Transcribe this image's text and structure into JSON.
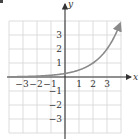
{
  "chart_data": {
    "type": "line",
    "title": "",
    "xlabel": "x",
    "ylabel": "y",
    "xlim": [
      -4,
      4
    ],
    "ylim": [
      -4,
      4
    ],
    "grid": true,
    "x_ticks": [
      -3,
      -2,
      -1,
      1,
      2,
      3
    ],
    "y_ticks": [
      -3,
      -2,
      -1,
      1,
      2,
      3
    ],
    "x_tick_labels": [
      "−3",
      "−2",
      "−1",
      "1",
      "2",
      "3"
    ],
    "y_tick_labels": [
      "−3",
      "−2",
      "−1",
      "1",
      "2",
      "3"
    ],
    "series": [
      {
        "name": "y = 2^(x-2)",
        "x": [
          -4,
          -3,
          -2,
          -1,
          0,
          1,
          2,
          3,
          4
        ],
        "values": [
          0.016,
          0.031,
          0.063,
          0.125,
          0.25,
          0.5,
          1,
          2,
          4
        ],
        "color": "#8a8a8a",
        "arrow_end": true
      }
    ]
  },
  "colors": {
    "grid": "#d4d4d4",
    "axis": "#333333",
    "curve": "#8a8a8a"
  }
}
